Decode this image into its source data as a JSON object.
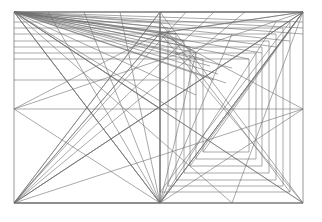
{
  "figure": {
    "title": "Recursive rectangle subdivision construction",
    "type": "geometric-line-diagram",
    "canvas": {
      "width": 322,
      "height": 222,
      "background": "#ffffff"
    },
    "stroke": {
      "color": "#6e6e6e",
      "frame_color": "#8c8c8c",
      "width": 0.6,
      "frame_width": 0.9
    },
    "frame": {
      "x0": 14,
      "y0": 12,
      "x1": 303,
      "y1": 203
    },
    "labels": {
      "caption": "",
      "alt": "Nested rectangles with full diagonals and corner fans"
    }
  },
  "chart_data": {
    "type": "line",
    "title": "Recursive rectangle subdivision construction",
    "xlabel": "",
    "ylabel": "",
    "xlim": [
      0,
      322
    ],
    "ylim": [
      0,
      222
    ],
    "grid": false,
    "legend": "none",
    "vertices": {
      "frame_top_left": [
        14,
        12
      ],
      "frame_top_right": [
        303,
        12
      ],
      "frame_bottom_left": [
        14,
        203
      ],
      "frame_bottom_right": [
        303,
        203
      ],
      "mid_top": [
        160,
        12
      ],
      "mid_bottom": [
        160,
        203
      ],
      "mid_left": [
        14,
        109
      ],
      "mid_right": [
        303,
        109
      ],
      "centre": [
        160,
        109
      ],
      "fan_focus_upper": [
        160,
        33
      ],
      "quarter_left": [
        87,
        109
      ],
      "quarter_right": [
        232,
        109
      ]
    },
    "series": [
      {
        "name": "outer-frame",
        "kind": "rect",
        "values": [
          [
            14,
            12
          ],
          [
            303,
            12
          ],
          [
            303,
            203
          ],
          [
            14,
            203
          ]
        ]
      },
      {
        "name": "mid-horizontal",
        "kind": "segment",
        "values": [
          [
            14,
            109
          ],
          [
            303,
            109
          ]
        ]
      },
      {
        "name": "mid-vertical",
        "kind": "segment",
        "values": [
          [
            160,
            12
          ],
          [
            160,
            203
          ]
        ]
      },
      {
        "name": "outer-diagonal-a",
        "kind": "segment",
        "values": [
          [
            14,
            12
          ],
          [
            303,
            203
          ]
        ]
      },
      {
        "name": "outer-diagonal-b",
        "kind": "segment",
        "values": [
          [
            303,
            12
          ],
          [
            14,
            203
          ]
        ]
      },
      {
        "name": "left-half-diagonal-a",
        "kind": "segment",
        "values": [
          [
            14,
            12
          ],
          [
            160,
            203
          ]
        ]
      },
      {
        "name": "left-half-diagonal-b",
        "kind": "segment",
        "values": [
          [
            160,
            12
          ],
          [
            14,
            203
          ]
        ]
      },
      {
        "name": "right-half-diagonal-a",
        "kind": "segment",
        "values": [
          [
            160,
            12
          ],
          [
            303,
            203
          ]
        ]
      },
      {
        "name": "right-half-diagonal-b",
        "kind": "segment",
        "values": [
          [
            303,
            12
          ],
          [
            160,
            203
          ]
        ]
      },
      {
        "name": "nested-rect-1",
        "kind": "rect",
        "values": [
          [
            160,
            22
          ],
          [
            290,
            22
          ],
          [
            290,
            192
          ],
          [
            160,
            192
          ]
        ]
      },
      {
        "name": "nested-rect-2",
        "kind": "rect",
        "values": [
          [
            168,
            28
          ],
          [
            283,
            28
          ],
          [
            283,
            186
          ],
          [
            168,
            186
          ]
        ]
      },
      {
        "name": "nested-rect-3",
        "kind": "rect",
        "values": [
          [
            176,
            34
          ],
          [
            276,
            34
          ],
          [
            276,
            180
          ],
          [
            176,
            180
          ]
        ]
      },
      {
        "name": "nested-rect-4",
        "kind": "rect",
        "values": [
          [
            184,
            41
          ],
          [
            269,
            41
          ],
          [
            269,
            173
          ],
          [
            184,
            173
          ]
        ]
      },
      {
        "name": "nested-rect-5",
        "kind": "rect",
        "values": [
          [
            190,
            47
          ],
          [
            262,
            47
          ],
          [
            262,
            166
          ],
          [
            190,
            166
          ]
        ]
      },
      {
        "name": "nested-rect-6",
        "kind": "rect",
        "values": [
          [
            196,
            53
          ],
          [
            256,
            53
          ],
          [
            256,
            159
          ],
          [
            196,
            159
          ]
        ]
      },
      {
        "name": "nested-rect-7",
        "kind": "rect",
        "values": [
          [
            203,
            59
          ],
          [
            249,
            59
          ],
          [
            249,
            152
          ],
          [
            203,
            152
          ]
        ]
      },
      {
        "name": "inner-diagonal-a",
        "kind": "segment",
        "values": [
          [
            160,
            22
          ],
          [
            290,
            192
          ]
        ]
      },
      {
        "name": "inner-diagonal-b",
        "kind": "segment",
        "values": [
          [
            290,
            22
          ],
          [
            160,
            192
          ]
        ]
      },
      {
        "name": "fan-top-left",
        "kind": "fan",
        "origin": [
          14,
          12
        ],
        "targets": [
          [
            303,
            12
          ],
          [
            303,
            22
          ],
          [
            303,
            28
          ],
          [
            303,
            34
          ],
          [
            290,
            41
          ],
          [
            276,
            47
          ],
          [
            262,
            53
          ],
          [
            249,
            59
          ],
          [
            232,
            68
          ],
          [
            214,
            80
          ],
          [
            196,
            95
          ],
          [
            178,
            112
          ],
          [
            160,
            33
          ],
          [
            160,
            109
          ],
          [
            160,
            203
          ],
          [
            232,
            203
          ],
          [
            303,
            203
          ]
        ]
      },
      {
        "name": "fan-bottom-left",
        "kind": "fan",
        "origin": [
          14,
          203
        ],
        "targets": [
          [
            160,
            12
          ],
          [
            186,
            12
          ],
          [
            214,
            12
          ],
          [
            245,
            12
          ],
          [
            303,
            12
          ],
          [
            303,
            109
          ],
          [
            160,
            33
          ],
          [
            160,
            203
          ],
          [
            303,
            203
          ]
        ]
      },
      {
        "name": "fan-bottom-centre",
        "kind": "fan",
        "origin": [
          160,
          203
        ],
        "targets": [
          [
            14,
            12
          ],
          [
            48,
            12
          ],
          [
            84,
            12
          ],
          [
            120,
            12
          ],
          [
            160,
            12
          ],
          [
            196,
            53
          ],
          [
            232,
            34
          ],
          [
            276,
            22
          ],
          [
            303,
            12
          ],
          [
            14,
            109
          ],
          [
            303,
            109
          ],
          [
            14,
            203
          ],
          [
            303,
            203
          ]
        ]
      },
      {
        "name": "fan-top-right",
        "kind": "fan",
        "origin": [
          303,
          12
        ],
        "targets": [
          [
            14,
            12
          ],
          [
            14,
            109
          ],
          [
            14,
            203
          ],
          [
            160,
            203
          ],
          [
            160,
            12
          ],
          [
            160,
            33
          ],
          [
            190,
            166
          ],
          [
            203,
            152
          ],
          [
            232,
            203
          ]
        ]
      },
      {
        "name": "fan-upper-focus",
        "kind": "fan",
        "origin": [
          160,
          33
        ],
        "targets": [
          [
            14,
            12
          ],
          [
            14,
            109
          ],
          [
            14,
            203
          ],
          [
            160,
            12
          ],
          [
            160,
            203
          ],
          [
            303,
            12
          ],
          [
            303,
            109
          ],
          [
            303,
            203
          ],
          [
            196,
            53
          ],
          [
            184,
            41
          ],
          [
            176,
            34
          ]
        ]
      },
      {
        "name": "ladder-left-rays",
        "kind": "fan",
        "origin": [
          14,
          12
        ],
        "targets": [
          [
            184,
            41
          ],
          [
            190,
            47
          ],
          [
            196,
            53
          ],
          [
            203,
            59
          ],
          [
            176,
            34
          ],
          [
            168,
            28
          ],
          [
            160,
            22
          ],
          [
            210,
            66
          ],
          [
            218,
            74
          ],
          [
            226,
            83
          ]
        ]
      },
      {
        "name": "left-rect-steps",
        "kind": "polyline-set",
        "values": [
          [
            [
              14,
              22
            ],
            [
              160,
              22
            ]
          ],
          [
            [
              14,
              28
            ],
            [
              168,
              28
            ]
          ],
          [
            [
              14,
              34
            ],
            [
              176,
              34
            ]
          ],
          [
            [
              14,
              41
            ],
            [
              184,
              41
            ]
          ],
          [
            [
              14,
              47
            ],
            [
              190,
              47
            ]
          ],
          [
            [
              14,
              53
            ],
            [
              196,
              53
            ]
          ],
          [
            [
              14,
              59
            ],
            [
              203,
              59
            ]
          ],
          [
            [
              14,
              80
            ],
            [
              160,
              80
            ]
          ]
        ]
      }
    ]
  }
}
